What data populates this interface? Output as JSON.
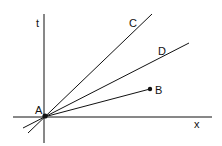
{
  "diagram": {
    "type": "spacetime-diagram",
    "axes": {
      "vertical_label": "t",
      "horizontal_label": "x"
    },
    "points": {
      "A": "A",
      "B": "B"
    },
    "lines": {
      "C": "C",
      "D": "D"
    },
    "colors": {
      "stroke": "#111111",
      "background": "#ffffff"
    }
  }
}
